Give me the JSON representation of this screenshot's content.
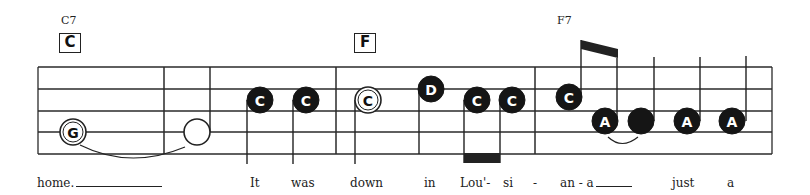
{
  "chords": [
    {
      "name": "C7",
      "box": "C",
      "name_x": 60,
      "box_x": 60
    },
    {
      "name": "",
      "box": "F",
      "name_x": 355,
      "box_x": 355
    },
    {
      "name": "F7",
      "box": "",
      "name_x": 557,
      "box_x": 0
    }
  ],
  "staff": {
    "left": 38,
    "right": 772,
    "lines_y": [
      67,
      89,
      111,
      132,
      154
    ],
    "barlines_x": [
      164,
      336,
      535
    ],
    "line_color": "#2a2a2a"
  },
  "notes": [
    {
      "label": "G",
      "x": 73,
      "y": 132,
      "style": "open-letter"
    },
    {
      "label": "",
      "x": 197,
      "y": 132,
      "style": "open-blank"
    },
    {
      "label": "C",
      "x": 260,
      "y": 100,
      "style": "filled"
    },
    {
      "label": "C",
      "x": 306,
      "y": 100,
      "style": "filled"
    },
    {
      "label": "C",
      "x": 368,
      "y": 100,
      "style": "open-letter"
    },
    {
      "label": "D",
      "x": 431,
      "y": 89,
      "style": "filled"
    },
    {
      "label": "C",
      "x": 477,
      "y": 100,
      "style": "filled"
    },
    {
      "label": "C",
      "x": 512,
      "y": 100,
      "style": "filled"
    },
    {
      "label": "C",
      "x": 569,
      "y": 97,
      "style": "filled"
    },
    {
      "label": "A",
      "x": 605,
      "y": 121,
      "style": "filled"
    },
    {
      "label": "",
      "x": 641,
      "y": 121,
      "style": "filled-blank"
    },
    {
      "label": "A",
      "x": 687,
      "y": 121,
      "style": "filled"
    },
    {
      "label": "A",
      "x": 732,
      "y": 121,
      "style": "filled"
    }
  ],
  "lyrics": [
    {
      "text": "home.",
      "x": 37,
      "extender": 86
    },
    {
      "text": "It",
      "x": 250
    },
    {
      "text": "was",
      "x": 291
    },
    {
      "text": "down",
      "x": 350
    },
    {
      "text": "in",
      "x": 424
    },
    {
      "text": "Lou'-",
      "x": 460
    },
    {
      "text": "si",
      "x": 503
    },
    {
      "text": "-",
      "x": 533
    },
    {
      "text": "an - a",
      "x": 560,
      "extender": 36
    },
    {
      "text": "just",
      "x": 672
    },
    {
      "text": "a",
      "x": 727
    }
  ]
}
